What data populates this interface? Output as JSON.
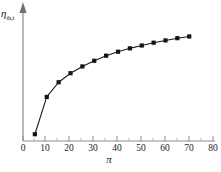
{
  "chart_data": {
    "type": "line",
    "title": "",
    "subtitle": "",
    "xlabel": "π",
    "ylabel": "η",
    "ylabel_subscript": "th,i",
    "x": [
      5,
      10,
      15,
      20,
      25,
      30,
      35,
      40,
      45,
      50,
      55,
      60,
      65,
      70
    ],
    "values": [
      0.06,
      0.39,
      0.52,
      0.6,
      0.66,
      0.71,
      0.755,
      0.79,
      0.82,
      0.845,
      0.87,
      0.89,
      0.91,
      0.925
    ],
    "series": [
      {
        "name": "eta-th-i",
        "values": [
          0.06,
          0.39,
          0.52,
          0.6,
          0.66,
          0.71,
          0.755,
          0.79,
          0.82,
          0.845,
          0.87,
          0.89,
          0.91,
          0.925
        ]
      }
    ],
    "xlim": [
      0,
      80
    ],
    "ylim": [
      0,
      1.0
    ],
    "xticks": [
      0,
      10,
      20,
      30,
      40,
      50,
      60,
      70,
      80
    ],
    "xtick_labels": [
      "0",
      "10",
      "20",
      "30",
      "40",
      "50",
      "60",
      "70",
      "80"
    ],
    "x_minor_tick_step": 5,
    "yticks": [],
    "ytick_labels": [],
    "grid": false,
    "legend": null,
    "legend_position": "none",
    "marker": "square",
    "annotations": []
  },
  "axes": {
    "x_axis_name": "pi-axis",
    "y_axis_name": "eta-axis",
    "y_axis_has_arrow": true,
    "x_axis_color": "#8c8c8c",
    "y_axis_color": "#8c8c8c",
    "line_color": "#1a1a1a",
    "marker_color": "#141414"
  }
}
